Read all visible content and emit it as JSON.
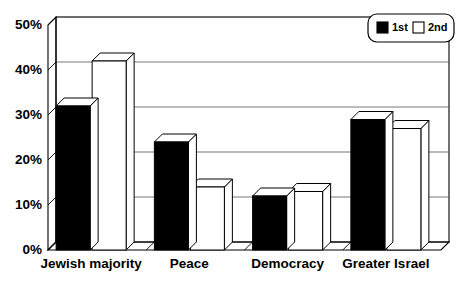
{
  "chart_data": {
    "type": "bar",
    "title": "",
    "subtitle": "",
    "xlabel": "",
    "ylabel": "",
    "categories": [
      "Jewish majority",
      "Peace",
      "Democracy",
      "Greater Israel"
    ],
    "series": [
      {
        "name": "1st",
        "values": [
          32,
          42,
          12,
          29
        ],
        "color": "#000000"
      },
      {
        "name": "2nd",
        "values": [
          42,
          14,
          13,
          27
        ],
        "color": "#ffffff"
      }
    ],
    "series_ordered": [
      {
        "name": "1st",
        "values": [
          32,
          24,
          12,
          29
        ],
        "color": "#000000"
      },
      {
        "name": "2nd",
        "values": [
          42,
          14,
          13,
          27
        ],
        "color": "#ffffff"
      }
    ],
    "ylim": [
      0,
      50
    ],
    "ytick_labels": [
      "0%",
      "10%",
      "20%",
      "30%",
      "40%",
      "50%"
    ],
    "ytick_values": [
      0,
      10,
      20,
      30,
      40,
      50
    ],
    "grid": true,
    "grid_axis": "y",
    "legend": [
      "1st",
      "2nd"
    ],
    "legend_position": "top-right",
    "style": "3d-column",
    "plot_background": "#ffffff",
    "axis_color": "#000000",
    "gridline_color": "#555555"
  },
  "legend": {
    "items": [
      {
        "label": "1st",
        "swatch": "#000000",
        "swatch_name": "legend-swatch-black"
      },
      {
        "label": "2nd",
        "swatch": "#ffffff",
        "swatch_name": "legend-swatch-white"
      }
    ]
  },
  "axis": {
    "y_ticks": [
      "50%",
      "40%",
      "30%",
      "20%",
      "10%",
      "0%"
    ]
  },
  "categories": [
    "Jewish majority",
    "Peace",
    "Democracy",
    "Greater Israel"
  ]
}
